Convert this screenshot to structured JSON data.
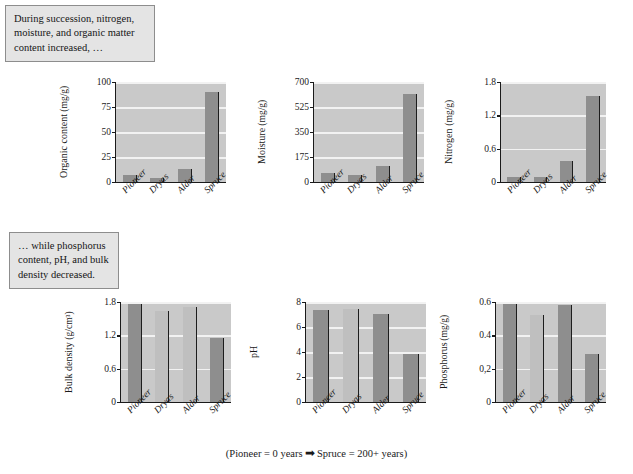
{
  "annotations": {
    "top": "During succession, nitrogen, moisture, and organic matter content increased, …",
    "bottom": "… while phosphorus content, pH, and bulk density decreased."
  },
  "caption": {
    "left": "(Pioneer = 0 years",
    "arrow": "➡",
    "right": "Spruce = 200+ years)"
  },
  "colors": {
    "plot_background": "#c9c9c9",
    "gridline": "#f2f2f2",
    "bar_dark": "#8e8e8e",
    "bar_light": "#bfbfbf",
    "axis": "#1a1a1a",
    "callout_background": "#e4e4e4",
    "callout_border": "#8d8d8d"
  },
  "chart_data": [
    {
      "id": "organic-content",
      "type": "bar",
      "title": "",
      "ylabel": "Organic content",
      "yunits": "(mg/g)",
      "xlabel": "",
      "categories": [
        "Pioneer",
        "Dryas",
        "Alder",
        "Spruce"
      ],
      "values": [
        7,
        4,
        13,
        90
      ],
      "ylim": [
        0,
        100
      ],
      "yticks": [
        0,
        25,
        50,
        75,
        100
      ],
      "yticklabels": [
        "0",
        "25",
        "50",
        "75",
        "100"
      ],
      "grid": true,
      "legend": "none"
    },
    {
      "id": "moisture",
      "type": "bar",
      "title": "",
      "ylabel": "Moisture",
      "yunits": "(mg/g)",
      "xlabel": "",
      "categories": [
        "Pioneer",
        "Dryas",
        "Alder",
        "Spruce"
      ],
      "values": [
        60,
        50,
        115,
        615
      ],
      "ylim": [
        0,
        700
      ],
      "yticks": [
        0,
        175,
        350,
        525,
        700
      ],
      "yticklabels": [
        "0",
        "175",
        "350",
        "525",
        "700"
      ],
      "grid": true,
      "legend": "none"
    },
    {
      "id": "nitrogen",
      "type": "bar",
      "title": "",
      "ylabel": "Nitrogen",
      "yunits": "(mg/g)",
      "xlabel": "",
      "categories": [
        "Pioneer",
        "Dryas",
        "Alder",
        "Spruce"
      ],
      "values": [
        0.09,
        0.09,
        0.38,
        1.55
      ],
      "ylim": [
        0,
        1.8
      ],
      "yticks": [
        0,
        0.6,
        1.2,
        1.8
      ],
      "yticklabels": [
        "0",
        "0.6",
        "1.2",
        "1.8"
      ],
      "grid": true,
      "legend": "none"
    },
    {
      "id": "bulk-density",
      "type": "bar",
      "title": "",
      "ylabel": "Bulk density",
      "yunits": "(g/cm³)",
      "xlabel": "",
      "categories": [
        "Pioneer",
        "Dryas",
        "Alder",
        "Spruce"
      ],
      "values": [
        1.77,
        1.64,
        1.71,
        1.16
      ],
      "ylim": [
        0,
        1.8
      ],
      "yticks": [
        0,
        0.6,
        1.2,
        1.8
      ],
      "yticklabels": [
        "0",
        "0.6",
        "1.2",
        "1.8"
      ],
      "grid": true,
      "legend": "none"
    },
    {
      "id": "ph",
      "type": "bar",
      "title": "",
      "ylabel": "pH",
      "yunits": "",
      "xlabel": "",
      "categories": [
        "Pioneer",
        "Dryas",
        "Alder",
        "Spruce"
      ],
      "values": [
        7.4,
        7.45,
        7.05,
        3.85
      ],
      "ylim": [
        0,
        8
      ],
      "yticks": [
        0,
        2,
        4,
        6,
        8
      ],
      "yticklabels": [
        "0",
        "2",
        "4",
        "6",
        "8"
      ],
      "grid": true,
      "legend": "none"
    },
    {
      "id": "phosphorus",
      "type": "bar",
      "title": "",
      "ylabel": "Phosphorus",
      "yunits": "(mg/g)",
      "xlabel": "",
      "categories": [
        "Pioneer",
        "Dryas",
        "Alder",
        "Spruce"
      ],
      "values": [
        0.59,
        0.52,
        0.58,
        0.29
      ],
      "ylim": [
        0,
        0.6
      ],
      "yticks": [
        0,
        0.2,
        0.4,
        0.6
      ],
      "yticklabels": [
        "0",
        "0,2",
        "0.4",
        "0.6"
      ],
      "grid": true,
      "legend": "none"
    }
  ]
}
